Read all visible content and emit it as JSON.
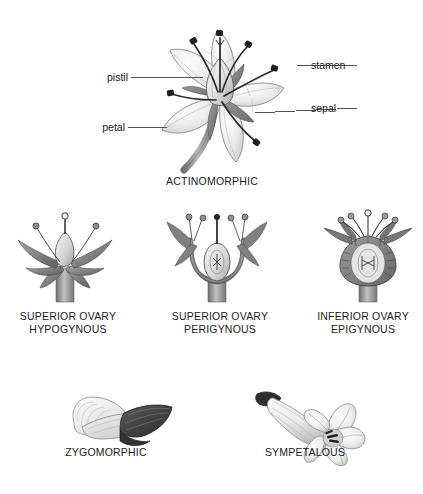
{
  "figure": {
    "kind": "botanical-diagram",
    "background_color": "#ffffff",
    "ink_color": "#1a1a1a"
  },
  "actinomorphic": {
    "caption": "ACTINOMORPHIC",
    "labels": [
      {
        "key": "pistil",
        "text": "pistil"
      },
      {
        "key": "petal",
        "text": "petal"
      },
      {
        "key": "stamen",
        "text": "stamen"
      },
      {
        "key": "sepal",
        "text": "sepal"
      }
    ]
  },
  "ovary_row": [
    {
      "key": "hypogynous",
      "line1": "SUPERIOR OVARY",
      "line2": "HYPOGYNOUS"
    },
    {
      "key": "perigynous",
      "line1": "SUPERIOR OVARY",
      "line2": "PERIGYNOUS"
    },
    {
      "key": "epigynous",
      "line1": "INFERIOR OVARY",
      "line2": "EPIGYNOUS"
    }
  ],
  "bottom_row": [
    {
      "key": "zygomorphic",
      "caption": "ZYGOMORPHIC"
    },
    {
      "key": "sympetalous",
      "caption": "SYMPETALOUS"
    }
  ],
  "palette": {
    "petal_light": "#f2f2f2",
    "petal_mid": "#d8d8d8",
    "petal_shade": "#b4b4b4",
    "outline": "#6e6e6e",
    "dark_part": "#3a3a3a",
    "stem_gray": "#8c8c8c",
    "leader_line": "#555555"
  }
}
